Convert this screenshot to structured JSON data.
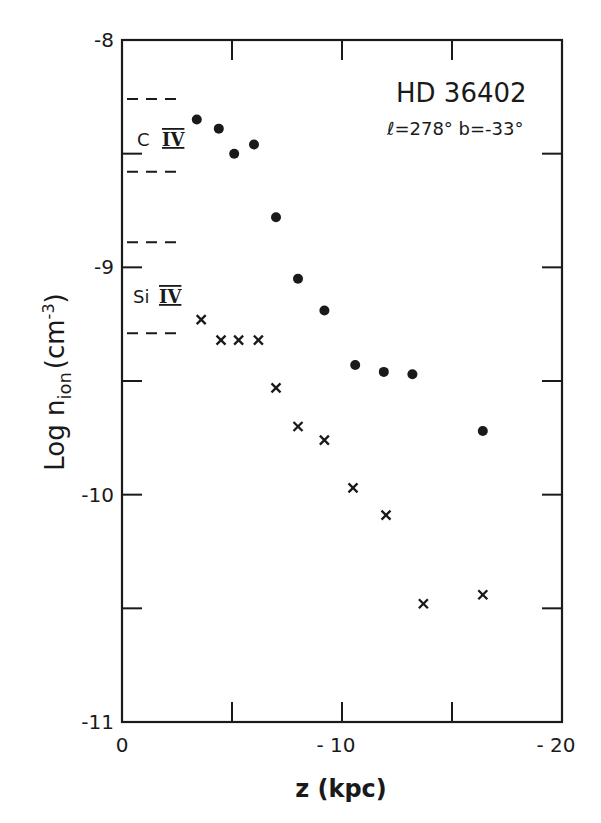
{
  "chart_data": {
    "type": "scatter",
    "title": "HD 36402",
    "subtitle": "l=278° b=-33°",
    "xlabel": "z (kpc)",
    "ylabel": "Log n_ion (cm^-3)",
    "ylabel_parts": {
      "main": "Log n",
      "sub": "ion",
      "unit_open": "(cm",
      "sup": "-3",
      "unit_close": ")"
    },
    "xlim": [
      0,
      -20
    ],
    "ylim": [
      -11,
      -8
    ],
    "x_ticks": [
      0,
      -5,
      -10,
      -15,
      -20
    ],
    "x_tick_labels": [
      {
        "value": 0,
        "label": "0"
      },
      {
        "value": -10,
        "label": "-10"
      },
      {
        "value": -20,
        "label": "-20"
      }
    ],
    "y_ticks": [
      -8,
      -8.5,
      -9,
      -9.5,
      -10,
      -10.5,
      -11
    ],
    "y_tick_labels": [
      {
        "value": -8,
        "label": "-8"
      },
      {
        "value": -9,
        "label": "-9"
      },
      {
        "value": -10,
        "label": "-10"
      },
      {
        "value": -11,
        "label": "-11"
      }
    ],
    "grid": false,
    "series": [
      {
        "name": "C IV",
        "marker": "filled-circle",
        "x": [
          -3.4,
          -4.4,
          -5.1,
          -6.0,
          -7.0,
          -8.0,
          -9.2,
          -10.6,
          -11.9,
          -13.2,
          -16.4
        ],
        "y": [
          -8.35,
          -8.39,
          -8.5,
          -8.46,
          -8.78,
          -9.05,
          -9.19,
          -9.43,
          -9.46,
          -9.47,
          -9.72
        ]
      },
      {
        "name": "Si IV",
        "marker": "cross",
        "x": [
          -3.6,
          -4.5,
          -5.3,
          -6.2,
          -7.0,
          -8.0,
          -9.2,
          -10.5,
          -12.0,
          -13.7,
          -16.4
        ],
        "y": [
          -9.23,
          -9.32,
          -9.32,
          -9.32,
          -9.53,
          -9.7,
          -9.76,
          -9.97,
          -10.09,
          -10.48,
          -10.44
        ]
      }
    ],
    "reference_ranges": [
      {
        "ion": "C IV",
        "label": "C IV",
        "upper": -8.26,
        "lower": -8.58,
        "label_y": -8.42
      },
      {
        "ion": "Si IV",
        "label": "Si IV",
        "upper": -8.89,
        "lower": -9.29,
        "label_y": -9.12
      }
    ],
    "annotations": [
      {
        "text": "HD 36402",
        "position": "upper-right"
      },
      {
        "text": "l=278° b=-33°",
        "position": "upper-right"
      }
    ]
  },
  "labels": {
    "title": "HD 36402",
    "subtitle": "ℓ=278°  b=-33°",
    "xlabel": "z (kpc)",
    "civ_element": "C",
    "civ_stage": "IV",
    "siiv_element": "Si",
    "siiv_stage": "IV"
  },
  "colors": {
    "ink": "#1a1a1a",
    "background": "#ffffff"
  }
}
